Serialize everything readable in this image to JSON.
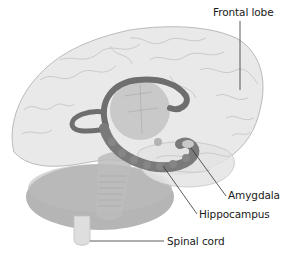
{
  "diagram": {
    "type": "anatomical-illustration",
    "labels": [
      {
        "id": "frontal-lobe",
        "text": "Frontal lobe"
      },
      {
        "id": "amygdala",
        "text": "Amygdala"
      },
      {
        "id": "hippocampus",
        "text": "Hippocampus"
      },
      {
        "id": "spinal-cord",
        "text": "Spinal cord"
      }
    ],
    "colors": {
      "background": "#ffffff",
      "cerebrum": "#e9e9e9",
      "cerebrum_outline": "#b8b8b8",
      "gyri_lines": "#c4c4c4",
      "limbic_ring": "#6f6f6f",
      "hippocampus": "#7a7a7a",
      "thalamus": "#bdbdbd",
      "cerebellum": "#a9a9a9",
      "brainstem": "#bcbcbc",
      "spinal_cord": "#dcdcdc",
      "leader_line": "#333333",
      "label_text": "#1a1a1a"
    }
  }
}
